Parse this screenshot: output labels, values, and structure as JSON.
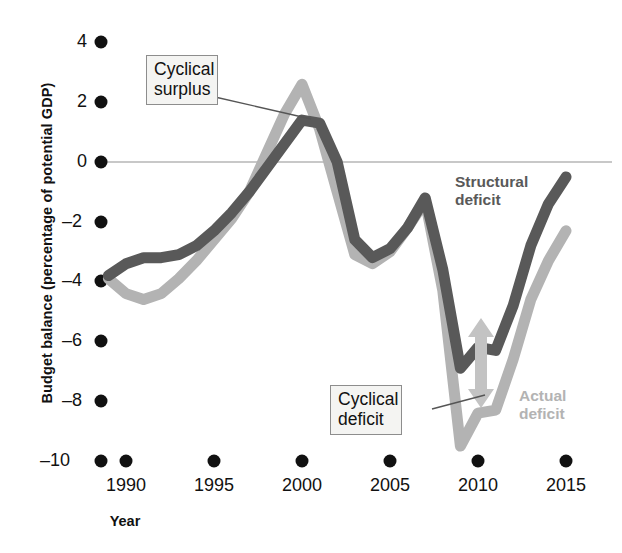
{
  "axes": {
    "ylabel": "Budget balance (percentage of potential GDP)",
    "xlabel": "Year",
    "yticks": [
      "4",
      "2",
      "0",
      "–2",
      "–4",
      "–6",
      "–8",
      "–10"
    ],
    "xticks": [
      "1990",
      "1995",
      "2000",
      "2005",
      "2010",
      "2015"
    ]
  },
  "annotations": {
    "cyclical_surplus_line1": "Cyclical",
    "cyclical_surplus_line2": "surplus",
    "cyclical_deficit_line1": "Cyclical",
    "cyclical_deficit_line2": "deficit",
    "structural_line1": "Structural",
    "structural_line2": "deficit",
    "actual_line1": "Actual",
    "actual_line2": "deficit"
  },
  "colors": {
    "structural": "#595959",
    "actual": "#b3b3b3",
    "zero_line": "#c8c8c8",
    "tick_dot": "#111111",
    "callout_bg": "#f4f4f2",
    "callout_border": "#8d8d8d",
    "leader": "#555555"
  },
  "chart_data": {
    "type": "line",
    "title": "",
    "xlabel": "Year",
    "ylabel": "Budget balance (percentage of potential GDP)",
    "xlim": [
      1989,
      2015.6
    ],
    "ylim": [
      -10,
      4
    ],
    "grid": false,
    "zero_line": 0,
    "legend_position": "inline-right",
    "x": [
      1989,
      1990,
      1991,
      1992,
      1993,
      1994,
      1995,
      1996,
      1997,
      1998,
      1999,
      2000,
      2001,
      2002,
      2003,
      2004,
      2005,
      2006,
      2007,
      2008,
      2009,
      2010,
      2011,
      2012,
      2013,
      2014,
      2015
    ],
    "series": [
      {
        "name": "Structural deficit",
        "color": "#595959",
        "values": [
          -3.8,
          -3.4,
          -3.2,
          -3.2,
          -3.1,
          -2.8,
          -2.3,
          -1.7,
          -1.0,
          -0.2,
          0.6,
          1.4,
          1.3,
          0.0,
          -2.6,
          -3.2,
          -2.9,
          -2.2,
          -1.2,
          -3.6,
          -6.9,
          -6.2,
          -6.3,
          -4.8,
          -2.8,
          -1.4,
          -0.5
        ]
      },
      {
        "name": "Actual deficit",
        "color": "#b3b3b3",
        "values": [
          -3.9,
          -4.4,
          -4.6,
          -4.4,
          -3.9,
          -3.3,
          -2.6,
          -1.9,
          -1.0,
          0.3,
          1.6,
          2.6,
          1.1,
          -1.0,
          -3.1,
          -3.4,
          -3.0,
          -2.2,
          -1.3,
          -4.3,
          -9.5,
          -8.4,
          -8.3,
          -6.6,
          -4.6,
          -3.3,
          -2.3
        ]
      }
    ],
    "annotations": [
      {
        "label": "Cyclical surplus",
        "points_to_year": 2000,
        "points_to_value": 2.0
      },
      {
        "label": "Cyclical deficit",
        "points_to_year": 2010.4,
        "points_to_value": -7.5
      },
      {
        "label": "Structural deficit",
        "near_year": 2013,
        "near_value": -1.6
      },
      {
        "label": "Actual deficit",
        "near_year": 2013.4,
        "near_value": -7.9
      }
    ]
  }
}
